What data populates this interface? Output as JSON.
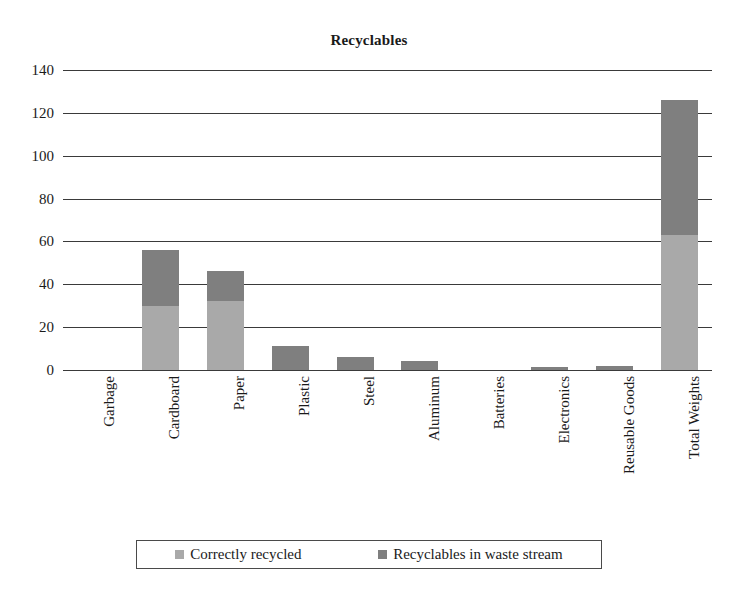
{
  "chart_data": {
    "type": "bar",
    "subtype": "stacked-column",
    "title": "Recyclables",
    "xlabel": "",
    "ylabel": "",
    "ylim": [
      0,
      140
    ],
    "ytick_step": 20,
    "yticks": [
      140,
      120,
      100,
      80,
      60,
      40,
      20,
      0
    ],
    "grid": true,
    "legend_position": "bottom",
    "categories": [
      "Garbage",
      "Cardboard",
      "Paper",
      "Plastic",
      "Steel",
      "Aluminum",
      "Batteries",
      "Electronics",
      "Reusable Goods",
      "Total Weights"
    ],
    "series": [
      {
        "name": "Correctly recycled",
        "color": "#a9a9a9",
        "values": [
          0,
          30,
          32,
          0,
          0,
          0,
          0,
          0,
          0,
          63
        ]
      },
      {
        "name": "Recyclables in waste stream",
        "color": "#7f7f7f",
        "values": [
          0,
          26,
          14,
          11,
          6,
          4,
          0,
          1.5,
          2,
          63
        ]
      }
    ],
    "totals": [
      0,
      56,
      46,
      11,
      6,
      4,
      0,
      1.5,
      2,
      126
    ]
  },
  "legend": {
    "items": [
      {
        "label": "Correctly recycled",
        "swatch": "#a9a9a9"
      },
      {
        "label": "Recyclables in waste stream",
        "swatch": "#7f7f7f"
      }
    ]
  }
}
